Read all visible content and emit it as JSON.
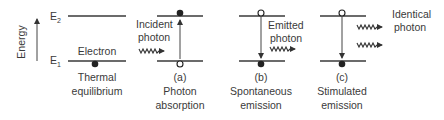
{
  "axis": {
    "label": "Energy",
    "upper_level": "E",
    "upper_sub": "2",
    "lower_level": "E",
    "lower_sub": "1"
  },
  "panels": [
    {
      "id": "thermal",
      "annotation": "Electron",
      "caption_letter": "",
      "caption_line1": "Thermal",
      "caption_line2": "equilibrium",
      "upper_state": "empty",
      "lower_state": "filled"
    },
    {
      "id": "absorption",
      "annotation_line1": "Incident",
      "annotation_line2": "photon",
      "caption_letter": "(a)",
      "caption_line1": "Photon",
      "caption_line2": "absorption",
      "upper_state": "filled",
      "lower_state": "hole",
      "transition": "up"
    },
    {
      "id": "spontaneous",
      "annotation_line1": "Emitted",
      "annotation_line2": "photon",
      "caption_letter": "(b)",
      "caption_line1": "Spontaneous",
      "caption_line2": "emission",
      "upper_state": "hole",
      "lower_state": "filled",
      "transition": "down"
    },
    {
      "id": "stimulated",
      "annotation_line1": "Identical",
      "annotation_line2": "photon",
      "caption_letter": "(c)",
      "caption_line1": "Stimulated",
      "caption_line2": "emission",
      "upper_state": "hole",
      "lower_state": "filled",
      "transition": "down"
    }
  ]
}
